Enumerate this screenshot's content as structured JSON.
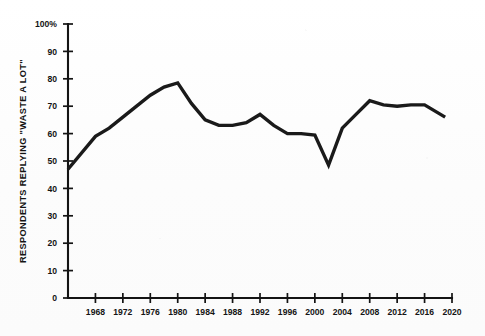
{
  "chart_data": {
    "type": "line",
    "title": "",
    "xlabel": "",
    "ylabel": "RESPONDENTS REPLYING \"WASTE A LOT\"",
    "xlim": [
      1964,
      2020
    ],
    "ylim": [
      0,
      100
    ],
    "grid": false,
    "legend": "none",
    "y_ticks": [
      "0",
      "10",
      "20",
      "30",
      "40",
      "50",
      "60",
      "70",
      "80",
      "90",
      "100%"
    ],
    "y_tick_values": [
      0,
      10,
      20,
      30,
      40,
      50,
      60,
      70,
      80,
      90,
      100
    ],
    "x_ticks": [
      "1968",
      "1972",
      "1976",
      "1980",
      "1984",
      "1988",
      "1992",
      "1996",
      "2000",
      "2004",
      "2008",
      "2012",
      "2016",
      "2020"
    ],
    "x_tick_values": [
      1968,
      1972,
      1976,
      1980,
      1984,
      1988,
      1992,
      1996,
      2000,
      2004,
      2008,
      2012,
      2016,
      2020
    ],
    "series": [
      {
        "name": "Respondents replying \"waste a lot\"",
        "color": "#1a1a1a",
        "x": [
          1964,
          1968,
          1970,
          1972,
          1974,
          1976,
          1978,
          1980,
          1982,
          1984,
          1986,
          1988,
          1990,
          1992,
          1994,
          1996,
          1998,
          2000,
          2002,
          2004,
          2006,
          2008,
          2010,
          2012,
          2014,
          2016,
          2019
        ],
        "values": [
          47,
          59,
          62,
          66,
          70,
          74,
          77,
          78.5,
          71,
          65,
          63,
          63,
          64,
          67,
          63,
          60,
          60,
          59.5,
          48.5,
          62,
          67,
          72,
          70.5,
          70,
          70.5,
          70.5,
          66
        ]
      }
    ]
  }
}
